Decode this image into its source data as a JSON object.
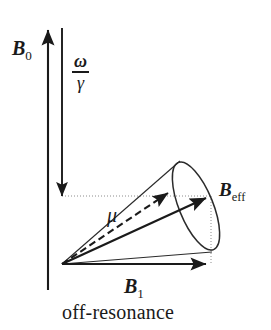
{
  "figure": {
    "caption": "off-resonance",
    "background_color": "#ffffff",
    "ink_color": "#1a1a1a",
    "guide_color": "#9a9a9a"
  },
  "labels": {
    "b0": {
      "symbol": "B",
      "subscript": "0",
      "name": "B-zero field vector label"
    },
    "b1": {
      "symbol": "B",
      "subscript": "1",
      "name": "B-one field vector label"
    },
    "beff": {
      "symbol": "B",
      "subscript": "eff",
      "name": "effective field vector label"
    },
    "mu": {
      "symbol": "μ",
      "name": "magnetic moment label"
    },
    "omega_gamma": {
      "numerator": "ω",
      "denominator": "γ",
      "name": "omega over gamma label"
    }
  },
  "vectors": {
    "b0": {
      "direction": "up",
      "from": [
        48,
        290
      ],
      "to": [
        48,
        26
      ]
    },
    "omega_over_gamma": {
      "direction": "down",
      "from": [
        62,
        28
      ],
      "to": [
        62,
        200
      ]
    },
    "b1": {
      "direction": "right",
      "from": [
        62,
        264
      ],
      "to": [
        211,
        264
      ]
    },
    "beff": {
      "direction": "up-right",
      "from": [
        62,
        264
      ],
      "to": [
        210,
        196
      ]
    },
    "mu": {
      "direction": "up-right",
      "from": [
        62,
        264
      ],
      "to": [
        172,
        190
      ],
      "style": "dashed"
    }
  },
  "cone": {
    "apex": [
      62,
      264
    ],
    "base_center": [
      196,
      206
    ],
    "base_rx": 17,
    "base_ry": 47,
    "base_rotation_deg": -22,
    "description": "precession cone about B_eff"
  },
  "guides": [
    {
      "type": "horizontal-dotted",
      "from": [
        62,
        196
      ],
      "to": [
        211,
        196
      ]
    },
    {
      "type": "vertical-dotted",
      "from": [
        211,
        196
      ],
      "to": [
        211,
        264
      ]
    }
  ]
}
